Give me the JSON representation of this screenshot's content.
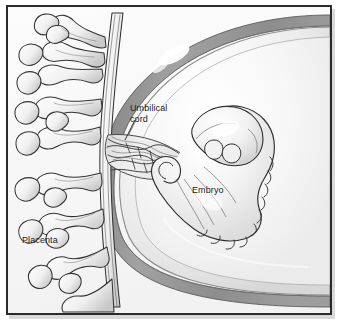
{
  "figure": {
    "kind": "medical-illustration",
    "style": "grayscale pen-and-ink shaded drawing in a thin black frame",
    "frame": {
      "border_color": "#2a2a2a",
      "border_width_px": 2,
      "margin_px": 5,
      "shadow_color": "#b9b9b9"
    },
    "palette": {
      "background": "#fbfbfb",
      "ink": "#1b1b1b",
      "uterine_wall": "#9a9a9a",
      "uterine_wall_dark": "#7d7d7d",
      "sac_fill": "#efefef",
      "sac_highlight": "#ffffff",
      "embryo_fill": "#f4f4f4",
      "villi_shade": "#bdbdbd",
      "cord_shade": "#8e8e8e"
    }
  },
  "labels": {
    "umbilical_cord": "Umbilical\ncord",
    "embryo": "Embryo",
    "placenta": "Placenta"
  },
  "structures": [
    {
      "name": "placenta",
      "label": "Placenta",
      "description": "Branching chorionic villi forming a tree-like network along the left side"
    },
    {
      "name": "umbilical-cord",
      "label": "Umbilical cord",
      "description": "Twisted bundle of vessels running from the placenta to the embryo's abdomen",
      "has_leader_line": true
    },
    {
      "name": "embryo",
      "label": "Embryo",
      "description": "C-curved embryo with a large head, limb buds and segmented somites along the back"
    },
    {
      "name": "amniotic-sac",
      "label": "",
      "description": "Large pale sphere enclosing the embryo, with a specular highlight at upper left"
    },
    {
      "name": "uterine-wall",
      "label": "",
      "description": "Thick gray arc forming the uterine wall around the sac"
    }
  ]
}
